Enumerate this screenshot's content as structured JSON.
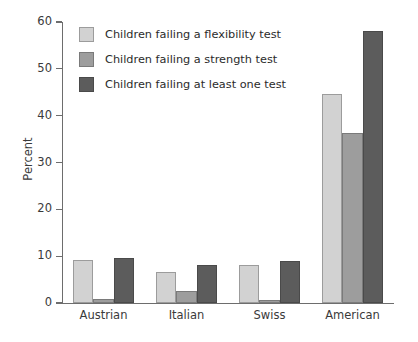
{
  "chart_data": {
    "type": "bar",
    "title": "",
    "subtitle": "",
    "xlabel": "",
    "ylabel": "Percent",
    "ylim": [
      0,
      60
    ],
    "yticks": [
      0,
      10,
      20,
      30,
      40,
      50,
      60
    ],
    "ytick_labels": [
      "0",
      "10",
      "20",
      "30",
      "40",
      "50",
      "60"
    ],
    "grid": false,
    "legend_position": "upper-left-inside",
    "categories": [
      "Austrian",
      "Italian",
      "Swiss",
      "American"
    ],
    "series": [
      {
        "name": "Children failing a flexibility test",
        "color": "#d2d2d2",
        "values": [
          9.1,
          6.6,
          8.2,
          44.7
        ]
      },
      {
        "name": "Children failing a strength test",
        "color": "#9d9d9d",
        "values": [
          0.9,
          2.5,
          0.7,
          36.3
        ]
      },
      {
        "name": "Children failing at least one test",
        "color": "#5c5c5c",
        "values": [
          9.6,
          8.2,
          9.0,
          58.0
        ]
      }
    ]
  },
  "axis": {
    "y_title": "Percent"
  },
  "colors": {
    "series_light": "#d2d2d2",
    "series_medium": "#9d9d9d",
    "series_dark": "#5c5c5c",
    "axis": "#6d6d6d",
    "text": "#2b2b2b",
    "background": "#ffffff"
  }
}
